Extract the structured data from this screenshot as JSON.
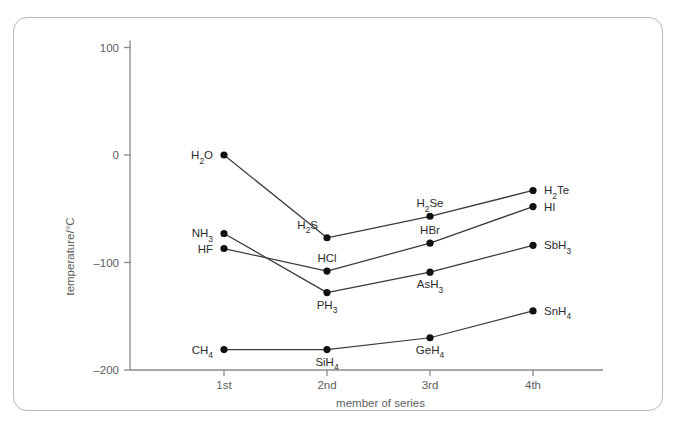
{
  "figure": {
    "frame_color": "#b6b6b6",
    "background": "#ffffff",
    "axis_color": "#8a8a8a",
    "line_color": "#3a3a3a",
    "marker_color": "#111111"
  },
  "chart_data": {
    "type": "line",
    "title": "",
    "xlabel": "member of series",
    "ylabel": "temperature/°C",
    "categories": [
      "1st",
      "2nd",
      "3rd",
      "4th"
    ],
    "x": [
      1,
      2,
      3,
      4
    ],
    "ylim": [
      -200,
      110
    ],
    "xlim": [
      0.4,
      4.6
    ],
    "yticks": [
      100,
      0,
      -100,
      -200
    ],
    "ytick_labels": [
      "100",
      "0",
      "–100",
      "–200"
    ],
    "xtick_labels": [
      "1st",
      "2nd",
      "3rd",
      "4th"
    ],
    "grid": false,
    "legend": "none",
    "series": [
      {
        "name": "group-16-hydrides",
        "values": [
          0,
          -77,
          -57,
          -33
        ],
        "point_labels": [
          "H2O",
          "H2S",
          "H2Se",
          "H2Te"
        ],
        "point_labels_display": [
          {
            "base": "H",
            "sub": "2",
            "tail": "O"
          },
          {
            "base": "H",
            "sub": "2",
            "tail": "S"
          },
          {
            "base": "H",
            "sub": "2",
            "tail": "Se"
          },
          {
            "base": "H",
            "sub": "2",
            "tail": "Te"
          }
        ],
        "label_anchor": [
          "end",
          "end",
          "middle",
          "start"
        ]
      },
      {
        "name": "group-17-hydrides",
        "values": [
          -87,
          -108,
          -82,
          -48
        ],
        "point_labels": [
          "HF",
          "HCl",
          "HBr",
          "HI"
        ],
        "point_labels_display": [
          {
            "base": "HF",
            "sub": "",
            "tail": ""
          },
          {
            "base": "HCl",
            "sub": "",
            "tail": ""
          },
          {
            "base": "HBr",
            "sub": "",
            "tail": ""
          },
          {
            "base": "HI",
            "sub": "",
            "tail": ""
          }
        ],
        "label_anchor": [
          "end",
          "middle",
          "middle",
          "start"
        ]
      },
      {
        "name": "group-15-hydrides",
        "values": [
          -73,
          -128,
          -109,
          -84
        ],
        "point_labels": [
          "NH3",
          "PH3",
          "AsH3",
          "SbH3"
        ],
        "point_labels_display": [
          {
            "base": "NH",
            "sub": "3",
            "tail": ""
          },
          {
            "base": "PH",
            "sub": "3",
            "tail": ""
          },
          {
            "base": "AsH",
            "sub": "3",
            "tail": ""
          },
          {
            "base": "SbH",
            "sub": "3",
            "tail": ""
          }
        ],
        "label_anchor": [
          "end",
          "middle",
          "middle",
          "start"
        ]
      },
      {
        "name": "group-14-hydrides",
        "values": [
          -181,
          -181,
          -170,
          -145
        ],
        "point_labels": [
          "CH4",
          "SiH4",
          "GeH4",
          "SnH4"
        ],
        "point_labels_display": [
          {
            "base": "CH",
            "sub": "4",
            "tail": ""
          },
          {
            "base": "SiH",
            "sub": "4",
            "tail": ""
          },
          {
            "base": "GeH",
            "sub": "4",
            "tail": ""
          },
          {
            "base": "SnH",
            "sub": "4",
            "tail": ""
          }
        ],
        "label_anchor": [
          "end",
          "middle",
          "middle",
          "start"
        ]
      }
    ]
  }
}
